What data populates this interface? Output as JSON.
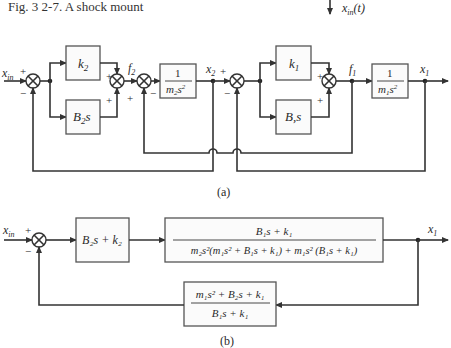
{
  "figure": {
    "title": "Fig. 3 2-7. A shock mount",
    "input_label": "x_in(t)",
    "input_label_main": "x",
    "input_label_sub": "in",
    "input_label_arg": "(t)"
  },
  "part_a": {
    "label": "(a)",
    "input": {
      "main": "x",
      "sub": "in"
    },
    "blocks": [
      {
        "id": "k2",
        "main": "k",
        "sub": "2"
      },
      {
        "id": "B2s",
        "main": "B",
        "sub": "2",
        "tail": "s"
      },
      {
        "id": "inv_m2",
        "num": "1",
        "den_main": "m",
        "den_sub": "2",
        "den_tail": "s",
        "den_sup": "2"
      },
      {
        "id": "k1",
        "main": "k",
        "sub": "1"
      },
      {
        "id": "B1s",
        "main": "B",
        "sub": ",",
        "tail": "s"
      },
      {
        "id": "inv_m1",
        "num": "1",
        "den_main": "m",
        "den_sub": "1",
        "den_tail": "s",
        "den_sup": "2"
      }
    ],
    "signals": {
      "f2": {
        "main": "f",
        "sub": "2"
      },
      "x2": {
        "main": "x",
        "sub": "2"
      },
      "f1": {
        "main": "f",
        "sub": "1"
      },
      "x1": {
        "main": "x",
        "sub": "1"
      }
    },
    "signs": {
      "plus": "+",
      "minus": "−"
    }
  },
  "part_b": {
    "label": "(b)",
    "input": {
      "main": "x",
      "sub": "in"
    },
    "output": {
      "main": "x",
      "sub": "1"
    },
    "forward_block_1": "B₂s + k₂",
    "forward_block_2": {
      "numerator": "B₁s + k₁",
      "denominator": "m₂s²(m₁s² + B₁s + k₁) + m₁s² (B₁s + k₁)"
    },
    "feedback_block": {
      "numerator": "m₁s² + B₂s + k₁",
      "denominator": "B₁s + k₁"
    },
    "signs": {
      "plus": "+",
      "minus": "−"
    }
  }
}
